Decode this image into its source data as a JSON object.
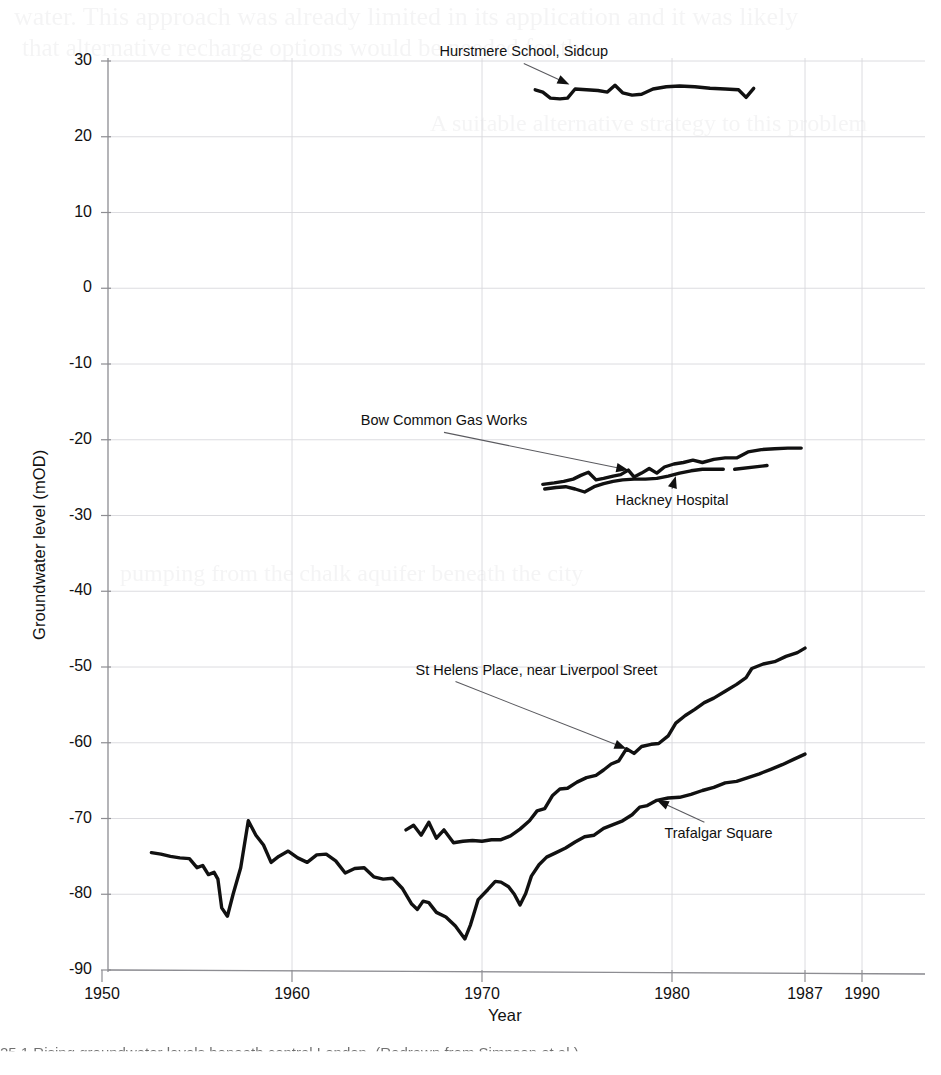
{
  "document": {
    "caption_fragment": "25.1  Rising groundwater levels beneath central London. (Redrawn from Simpson et al.)",
    "bleed_through_lines": [
      "water. This approach was already limited in its application and it was likely",
      "that alternative recharge options would be needed for the",
      "A suitable alternative strategy to this problem",
      "pumping from the chalk aquifer beneath the city"
    ]
  },
  "chart_data": {
    "type": "line",
    "title": "",
    "xlabel": "Year",
    "ylabel": "Groundwater level (mOD)",
    "xlim": [
      1950,
      1992
    ],
    "ylim": [
      -90,
      30
    ],
    "xticks": [
      1950,
      1960,
      1970,
      1980,
      1987,
      1990
    ],
    "xtick_labels": [
      "1950",
      "1960",
      "1970",
      "1980",
      "1987",
      "1990"
    ],
    "yticks": [
      30,
      20,
      10,
      0,
      -10,
      -20,
      -30,
      -40,
      -50,
      -60,
      -70,
      -80,
      -90
    ],
    "ytick_labels": [
      "30",
      "20",
      "10",
      "0",
      "-10",
      "-20",
      "-30",
      "-40",
      "-50",
      "-60",
      "-70",
      "-80",
      "-90"
    ],
    "grid": true,
    "legend": "annotations-with-leader-lines",
    "line_color": "#111111",
    "series": [
      {
        "name": "Hurstmere School, Sidcup",
        "label_x": 1972.2,
        "label_y": 30.6,
        "label_anchor": "middle",
        "arrow_to": [
          1974.6,
          26.9
        ],
        "points": [
          [
            1972.8,
            26.2
          ],
          [
            1973.2,
            25.9
          ],
          [
            1973.6,
            25.1
          ],
          [
            1974.1,
            25.0
          ],
          [
            1974.5,
            25.1
          ],
          [
            1974.9,
            26.3
          ],
          [
            1975.5,
            26.2
          ],
          [
            1976.1,
            26.1
          ],
          [
            1976.6,
            25.9
          ],
          [
            1977.0,
            26.8
          ],
          [
            1977.4,
            25.8
          ],
          [
            1977.9,
            25.5
          ],
          [
            1978.4,
            25.6
          ],
          [
            1979.0,
            26.3
          ],
          [
            1979.7,
            26.6
          ],
          [
            1980.4,
            26.7
          ],
          [
            1981.2,
            26.6
          ],
          [
            1982.0,
            26.4
          ],
          [
            1982.8,
            26.3
          ],
          [
            1983.5,
            26.2
          ],
          [
            1983.9,
            25.2
          ],
          [
            1984.3,
            26.4
          ]
        ]
      },
      {
        "name": "Bow Common Gas Works",
        "label_x": 1968.0,
        "label_y": -18.1,
        "label_anchor": "middle",
        "arrow_to": [
          1977.7,
          -24.0
        ],
        "points": [
          [
            1973.2,
            -25.9
          ],
          [
            1973.8,
            -25.7
          ],
          [
            1974.3,
            -25.5
          ],
          [
            1974.8,
            -25.2
          ],
          [
            1975.2,
            -24.7
          ],
          [
            1975.6,
            -24.3
          ],
          [
            1976.0,
            -25.3
          ],
          [
            1976.4,
            -25.1
          ],
          [
            1976.9,
            -24.8
          ],
          [
            1977.3,
            -24.6
          ],
          [
            1977.7,
            -24.0
          ],
          [
            1978.0,
            -24.9
          ],
          [
            1978.4,
            -24.4
          ],
          [
            1978.8,
            -23.8
          ],
          [
            1979.2,
            -24.4
          ],
          [
            1979.6,
            -23.6
          ],
          [
            1980.1,
            -23.2
          ],
          [
            1980.6,
            -23.0
          ],
          [
            1981.1,
            -22.7
          ],
          [
            1981.6,
            -23.0
          ],
          [
            1982.2,
            -22.6
          ],
          [
            1982.8,
            -22.4
          ],
          [
            1983.4,
            -22.4
          ],
          [
            1984.0,
            -21.6
          ],
          [
            1984.7,
            -21.3
          ],
          [
            1985.4,
            -21.2
          ],
          [
            1986.1,
            -21.1
          ],
          [
            1986.8,
            -21.1
          ]
        ]
      },
      {
        "name": "Hackney Hospital",
        "label_x": 1980.0,
        "label_y": -28.6,
        "label_anchor": "middle",
        "arrow_to": [
          1980.2,
          -24.8
        ],
        "points": [
          [
            1973.3,
            -26.5
          ],
          [
            1973.9,
            -26.3
          ],
          [
            1974.4,
            -26.2
          ],
          [
            1974.9,
            -26.5
          ],
          [
            1975.4,
            -26.9
          ],
          [
            1975.9,
            -26.2
          ],
          [
            1976.4,
            -25.8
          ],
          [
            1976.9,
            -25.5
          ],
          [
            1977.4,
            -25.3
          ],
          [
            1978.0,
            -25.2
          ],
          [
            1978.6,
            -25.2
          ],
          [
            1979.2,
            -25.1
          ],
          [
            1979.8,
            -24.8
          ],
          [
            1980.4,
            -24.4
          ],
          [
            1981.0,
            -24.1
          ],
          [
            1981.6,
            -23.9
          ],
          [
            1982.2,
            -23.9
          ],
          [
            1982.7,
            -23.9
          ]
        ],
        "dash_segment": [
          [
            1983.3,
            -23.9
          ],
          [
            1985.0,
            -23.4
          ]
        ]
      },
      {
        "name": "St Helens Place, near Liverpool Sreet",
        "label_x": 1966.5,
        "label_y": -51.0,
        "label_anchor": "start",
        "arrow_to": [
          1977.6,
          -60.8
        ],
        "points": [
          [
            1966.0,
            -71.5
          ],
          [
            1966.4,
            -70.9
          ],
          [
            1966.8,
            -72.2
          ],
          [
            1967.2,
            -70.5
          ],
          [
            1967.6,
            -72.6
          ],
          [
            1968.0,
            -71.5
          ],
          [
            1968.5,
            -73.2
          ],
          [
            1969.0,
            -73.0
          ],
          [
            1969.5,
            -72.9
          ],
          [
            1970.0,
            -73.0
          ],
          [
            1970.5,
            -72.8
          ],
          [
            1971.0,
            -72.8
          ],
          [
            1971.5,
            -72.3
          ],
          [
            1972.0,
            -71.4
          ],
          [
            1972.5,
            -70.3
          ],
          [
            1972.9,
            -69.0
          ],
          [
            1973.3,
            -68.7
          ],
          [
            1973.7,
            -67.0
          ],
          [
            1974.1,
            -66.1
          ],
          [
            1974.5,
            -66.0
          ],
          [
            1975.0,
            -65.2
          ],
          [
            1975.5,
            -64.6
          ],
          [
            1976.0,
            -64.3
          ],
          [
            1976.4,
            -63.6
          ],
          [
            1976.8,
            -62.8
          ],
          [
            1977.2,
            -62.4
          ],
          [
            1977.6,
            -60.8
          ],
          [
            1978.0,
            -61.4
          ],
          [
            1978.4,
            -60.5
          ],
          [
            1978.9,
            -60.2
          ],
          [
            1979.3,
            -60.1
          ],
          [
            1979.8,
            -59.1
          ],
          [
            1980.2,
            -57.4
          ],
          [
            1980.7,
            -56.4
          ],
          [
            1981.2,
            -55.6
          ],
          [
            1981.7,
            -54.7
          ],
          [
            1982.2,
            -54.1
          ],
          [
            1982.8,
            -53.2
          ],
          [
            1983.4,
            -52.3
          ],
          [
            1983.9,
            -51.4
          ],
          [
            1984.2,
            -50.2
          ],
          [
            1984.8,
            -49.6
          ],
          [
            1985.4,
            -49.3
          ],
          [
            1986.0,
            -48.6
          ],
          [
            1986.6,
            -48.1
          ],
          [
            1987.0,
            -47.5
          ]
        ]
      },
      {
        "name": "Trafalgar Square",
        "label_x": 1979.6,
        "label_y": -72.6,
        "label_anchor": "start",
        "arrow_to": [
          1979.2,
          -67.6
        ],
        "points": [
          [
            1952.6,
            -74.5
          ],
          [
            1953.1,
            -74.7
          ],
          [
            1953.6,
            -75.0
          ],
          [
            1954.1,
            -75.2
          ],
          [
            1954.6,
            -75.3
          ],
          [
            1955.0,
            -76.5
          ],
          [
            1955.3,
            -76.2
          ],
          [
            1955.6,
            -77.4
          ],
          [
            1955.9,
            -77.1
          ],
          [
            1956.1,
            -78.0
          ],
          [
            1956.3,
            -81.8
          ],
          [
            1956.6,
            -82.9
          ],
          [
            1956.9,
            -80.0
          ],
          [
            1957.3,
            -76.5
          ],
          [
            1957.7,
            -70.3
          ],
          [
            1958.1,
            -72.2
          ],
          [
            1958.5,
            -73.5
          ],
          [
            1958.9,
            -75.8
          ],
          [
            1959.3,
            -75.0
          ],
          [
            1959.8,
            -74.3
          ],
          [
            1960.3,
            -75.2
          ],
          [
            1960.8,
            -75.8
          ],
          [
            1961.3,
            -74.8
          ],
          [
            1961.8,
            -74.7
          ],
          [
            1962.3,
            -75.6
          ],
          [
            1962.8,
            -77.2
          ],
          [
            1963.3,
            -76.6
          ],
          [
            1963.8,
            -76.5
          ],
          [
            1964.3,
            -77.7
          ],
          [
            1964.8,
            -78.0
          ],
          [
            1965.3,
            -77.9
          ],
          [
            1965.8,
            -79.2
          ],
          [
            1966.3,
            -81.3
          ],
          [
            1966.6,
            -82.0
          ],
          [
            1966.9,
            -80.9
          ],
          [
            1967.2,
            -81.1
          ],
          [
            1967.6,
            -82.4
          ],
          [
            1968.1,
            -83.0
          ],
          [
            1968.6,
            -84.2
          ],
          [
            1969.1,
            -85.9
          ],
          [
            1969.4,
            -84.0
          ],
          [
            1969.8,
            -80.7
          ],
          [
            1970.3,
            -79.4
          ],
          [
            1970.7,
            -78.3
          ],
          [
            1971.0,
            -78.4
          ],
          [
            1971.4,
            -79.0
          ],
          [
            1971.7,
            -80.0
          ],
          [
            1972.0,
            -81.4
          ],
          [
            1972.3,
            -79.9
          ],
          [
            1972.6,
            -77.6
          ],
          [
            1973.0,
            -76.1
          ],
          [
            1973.4,
            -75.1
          ],
          [
            1973.9,
            -74.5
          ],
          [
            1974.4,
            -73.9
          ],
          [
            1974.9,
            -73.1
          ],
          [
            1975.4,
            -72.4
          ],
          [
            1975.9,
            -72.2
          ],
          [
            1976.4,
            -71.3
          ],
          [
            1976.9,
            -70.8
          ],
          [
            1977.4,
            -70.3
          ],
          [
            1977.9,
            -69.5
          ],
          [
            1978.3,
            -68.5
          ],
          [
            1978.7,
            -68.3
          ],
          [
            1979.2,
            -67.6
          ],
          [
            1979.8,
            -67.3
          ],
          [
            1980.4,
            -67.2
          ],
          [
            1981.0,
            -66.8
          ],
          [
            1981.6,
            -66.3
          ],
          [
            1982.2,
            -65.9
          ],
          [
            1982.8,
            -65.3
          ],
          [
            1983.4,
            -65.1
          ],
          [
            1984.0,
            -64.6
          ],
          [
            1984.6,
            -64.1
          ],
          [
            1985.2,
            -63.5
          ],
          [
            1985.8,
            -62.9
          ],
          [
            1986.4,
            -62.2
          ],
          [
            1987.0,
            -61.5
          ]
        ]
      }
    ]
  }
}
